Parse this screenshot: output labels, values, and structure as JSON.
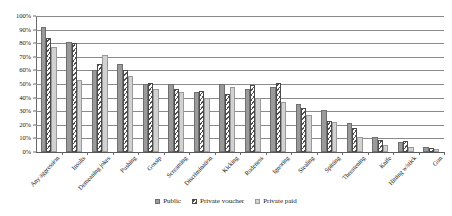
{
  "chart_data": {
    "type": "bar",
    "title": "",
    "subtitle": "",
    "xlabel": "",
    "ylabel": "",
    "ylim": [
      0,
      100
    ],
    "ytick_labels": [
      "0%",
      "10%",
      "20%",
      "30%",
      "40%",
      "50%",
      "60%",
      "70%",
      "80%",
      "90%",
      "100%"
    ],
    "ytick_values": [
      0,
      10,
      20,
      30,
      40,
      50,
      60,
      70,
      80,
      90,
      100
    ],
    "grid": true,
    "grid_axis": "y",
    "legend_position": "bottom",
    "categories": [
      "Any aggression",
      "Insults",
      "Demeaning jokes",
      "Pushing",
      "Gossip",
      "Screaming",
      "Discrimination",
      "Kicking",
      "Rudeness",
      "Ignoring",
      "Stealing",
      "Spitting",
      "Threatening",
      "Knife",
      "Hitting w/stick",
      "Gun"
    ],
    "series": [
      {
        "name": "Public",
        "color": "#9a9a9a",
        "pattern": "solid",
        "values": [
          92,
          81,
          60,
          65,
          50,
          50,
          44,
          50,
          46,
          48,
          35,
          31,
          21,
          11,
          7,
          4
        ]
      },
      {
        "name": "Private voucher",
        "color": "#ffffff",
        "pattern": "diagonal-hatch",
        "values": [
          84,
          80,
          65,
          60,
          51,
          46,
          45,
          43,
          49,
          51,
          32,
          23,
          18,
          9,
          8,
          3
        ]
      },
      {
        "name": "Private paid",
        "color": "#d2d2d2",
        "pattern": "solid-light",
        "values": [
          77,
          53,
          71,
          56,
          46,
          44,
          40,
          48,
          40,
          37,
          27,
          22,
          11,
          5,
          4,
          2
        ]
      }
    ]
  },
  "legend": {
    "items": [
      {
        "label": "Public",
        "swatch": "public"
      },
      {
        "label": "Private voucher",
        "swatch": "voucher"
      },
      {
        "label": "Private paid",
        "swatch": "paid"
      }
    ]
  }
}
